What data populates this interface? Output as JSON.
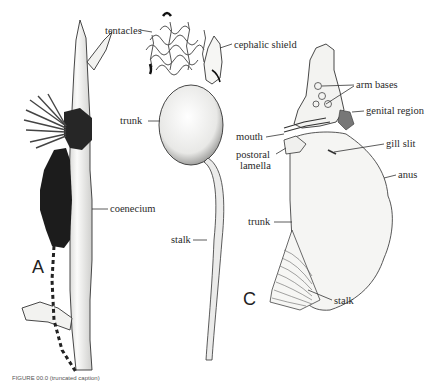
{
  "figure": {
    "panels": [
      {
        "id": "A",
        "label": "A"
      },
      {
        "id": "B",
        "label": ""
      },
      {
        "id": "C",
        "label": "C"
      }
    ],
    "labels": {
      "tentacles": "tentacles",
      "cephalic_shield": "cephalic shield",
      "trunk_b": "trunk",
      "coenecium": "coenecium",
      "stalk_b": "stalk",
      "arm_bases": "arm bases",
      "genital_region": "genital region",
      "mouth": "mouth",
      "postoral_lamella_1": "postoral",
      "postoral_lamella_2": "lamella",
      "gill_slit": "gill slit",
      "anus": "anus",
      "trunk_c": "trunk",
      "stalk_c": "stalk"
    },
    "caption": "FIGURE 00.0 (truncated caption)",
    "colors": {
      "ink": "#2a2a2a",
      "dark_body": "#1c1c1c",
      "fill_light": "#f4f4f2",
      "background": "#ffffff"
    }
  }
}
